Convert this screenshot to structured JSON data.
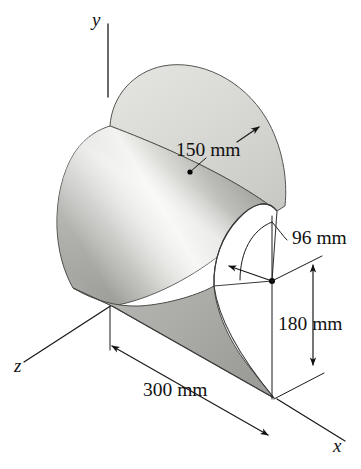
{
  "figure": {
    "background_color": "#ffffff",
    "ink_color": "#111111",
    "surface_light": "#d8d8d4",
    "surface_mid": "#b4b4b0",
    "surface_highlight": "#f2f2ef",
    "surface_dark": "#8e8e8a"
  },
  "axes": [
    {
      "id": "y",
      "label": "y",
      "label_x": 92,
      "label_y": 26
    },
    {
      "id": "z",
      "label": "z",
      "label_x": 14,
      "label_y": 372
    },
    {
      "id": "x",
      "label": "x",
      "label_x": 333,
      "label_y": 452
    }
  ],
  "dimensions": [
    {
      "id": "outer-radius",
      "label": "150 mm",
      "value": 150,
      "unit": "mm",
      "kind": "radius",
      "label_x": 176,
      "label_y": 156
    },
    {
      "id": "inner-radius",
      "label": "96 mm",
      "value": 96,
      "unit": "mm",
      "kind": "radius",
      "label_x": 292,
      "label_y": 244
    },
    {
      "id": "height",
      "label": "180 mm",
      "value": 180,
      "unit": "mm",
      "kind": "linear-vertical",
      "label_x": 278,
      "label_y": 330
    },
    {
      "id": "length",
      "label": "300 mm",
      "value": 300,
      "unit": "mm",
      "kind": "linear-depth",
      "label_x": 143,
      "label_y": 396
    }
  ],
  "markers": [
    {
      "id": "outer-radius-center",
      "x": 190,
      "y": 172
    },
    {
      "id": "inner-radius-center",
      "x": 272,
      "y": 281
    }
  ]
}
